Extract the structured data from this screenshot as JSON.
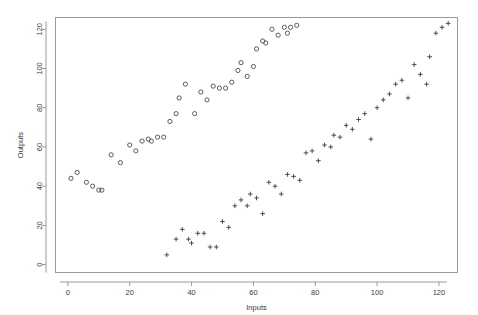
{
  "chart_data": {
    "type": "scatter",
    "title": "",
    "xlabel": "Inputs",
    "ylabel": "Outputs",
    "xlim": [
      -4,
      126
    ],
    "ylim": [
      -4,
      126
    ],
    "xticks": [
      0,
      20,
      40,
      60,
      80,
      100,
      120
    ],
    "yticks": [
      0,
      20,
      40,
      60,
      80,
      100,
      120
    ],
    "xtick_labels": [
      "0",
      "20",
      "40",
      "60",
      "80",
      "100",
      "120"
    ],
    "ytick_labels": [
      "0",
      "20",
      "40",
      "60",
      "80",
      "100",
      "120"
    ],
    "grid": false,
    "legend": "none",
    "marker_colors": {
      "circle": "#4a4a52",
      "plus": "#3c3c44",
      "frame": "#9a9a9a",
      "text": "#3a3a3a",
      "background": "#ffffff"
    },
    "series": [
      {
        "name": "Series 1",
        "marker": "circle",
        "points": [
          [
            1,
            44
          ],
          [
            3,
            47
          ],
          [
            6,
            42
          ],
          [
            8,
            40
          ],
          [
            10,
            38
          ],
          [
            11,
            38
          ],
          [
            14,
            56
          ],
          [
            17,
            52
          ],
          [
            20,
            61
          ],
          [
            22,
            58
          ],
          [
            24,
            63
          ],
          [
            26,
            64
          ],
          [
            27,
            63
          ],
          [
            29,
            65
          ],
          [
            31,
            65
          ],
          [
            33,
            73
          ],
          [
            35,
            77
          ],
          [
            36,
            85
          ],
          [
            38,
            92
          ],
          [
            41,
            77
          ],
          [
            43,
            88
          ],
          [
            45,
            84
          ],
          [
            47,
            91
          ],
          [
            49,
            90
          ],
          [
            51,
            90
          ],
          [
            53,
            93
          ],
          [
            55,
            99
          ],
          [
            56,
            103
          ],
          [
            58,
            96
          ],
          [
            60,
            101
          ],
          [
            61,
            110
          ],
          [
            63,
            114
          ],
          [
            64,
            113
          ],
          [
            66,
            120
          ],
          [
            68,
            117
          ],
          [
            70,
            121
          ],
          [
            71,
            118
          ],
          [
            72,
            121
          ],
          [
            74,
            122
          ]
        ]
      },
      {
        "name": "Series 2",
        "marker": "plus",
        "points": [
          [
            32,
            5
          ],
          [
            35,
            13
          ],
          [
            37,
            18
          ],
          [
            39,
            13
          ],
          [
            40,
            11
          ],
          [
            42,
            16
          ],
          [
            44,
            16
          ],
          [
            46,
            9
          ],
          [
            48,
            9
          ],
          [
            50,
            22
          ],
          [
            52,
            19
          ],
          [
            54,
            30
          ],
          [
            56,
            33
          ],
          [
            58,
            30
          ],
          [
            59,
            36
          ],
          [
            61,
            34
          ],
          [
            63,
            26
          ],
          [
            65,
            42
          ],
          [
            67,
            40
          ],
          [
            69,
            36
          ],
          [
            71,
            46
          ],
          [
            73,
            45
          ],
          [
            75,
            43
          ],
          [
            77,
            57
          ],
          [
            79,
            58
          ],
          [
            81,
            53
          ],
          [
            83,
            61
          ],
          [
            85,
            60
          ],
          [
            86,
            66
          ],
          [
            88,
            65
          ],
          [
            90,
            71
          ],
          [
            92,
            69
          ],
          [
            94,
            74
          ],
          [
            96,
            77
          ],
          [
            98,
            64
          ],
          [
            100,
            80
          ],
          [
            102,
            84
          ],
          [
            104,
            87
          ],
          [
            106,
            92
          ],
          [
            108,
            94
          ],
          [
            110,
            85
          ],
          [
            112,
            102
          ],
          [
            114,
            97
          ],
          [
            116,
            92
          ],
          [
            117,
            106
          ],
          [
            119,
            118
          ],
          [
            121,
            121
          ],
          [
            123,
            123
          ]
        ]
      }
    ]
  },
  "axes": {
    "x_title": "Inputs",
    "y_title": "Outputs"
  }
}
